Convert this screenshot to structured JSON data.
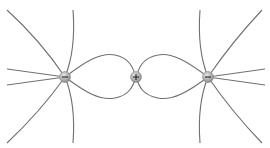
{
  "diagram": {
    "charges": [
      {
        "id": "left",
        "sign": "negative",
        "symbol": "−",
        "x": 65,
        "y": 77
      },
      {
        "id": "center",
        "sign": "positive",
        "symbol": "+",
        "x": 136,
        "y": 77
      },
      {
        "id": "right",
        "sign": "negative",
        "symbol": "−",
        "x": 208,
        "y": 77
      }
    ],
    "colors": {
      "line": "#707070",
      "charge_fill": "#b5b5b5",
      "background": "#ffffff"
    }
  }
}
